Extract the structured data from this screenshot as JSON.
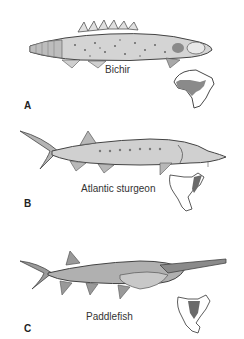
{
  "figure": {
    "panels": [
      {
        "letter": "A",
        "name": "Bichir",
        "range_map": "Africa"
      },
      {
        "letter": "B",
        "name": "Atlantic sturgeon",
        "range_map": "North America (eastern coast)"
      },
      {
        "letter": "C",
        "name": "Paddlefish",
        "range_map": "North America (Mississippi basin)"
      }
    ],
    "colors": {
      "ink": "#333333",
      "fish_body": "#c8c8c8",
      "fish_dark": "#7a7a7a",
      "range_fill": "#8a8a8a"
    }
  }
}
